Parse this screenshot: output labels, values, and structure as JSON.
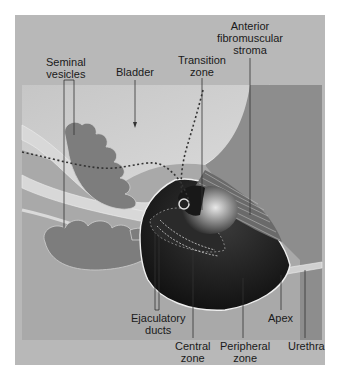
{
  "diagram": {
    "colors": {
      "frame": "#b8b8b8",
      "background_panel": "#a9a9a9",
      "bladder": "#c2c2c2",
      "anterior_region": "#8c8c8c",
      "seminal_vesicles": "#7d7d7d",
      "vas_deferens": "#d8d8d8",
      "peripheral_zone": "#141414",
      "central_zone": "#2a2a2a",
      "transition_zone": "#6e6e6e",
      "outline": "#e6e6e6",
      "leader_line": "#333333",
      "label_text": "#1a1a1a"
    },
    "labels": {
      "seminal_vesicles": [
        "Seminal",
        "vesicles"
      ],
      "bladder": [
        "Bladder"
      ],
      "transition_zone": [
        "Transition",
        "zone"
      ],
      "anterior_fibromuscular_stroma": [
        "Anterior",
        "fibromuscular",
        "stroma"
      ],
      "ejaculatory_ducts": [
        "Ejaculatory",
        "ducts"
      ],
      "central_zone": [
        "Central",
        "zone"
      ],
      "peripheral_zone": [
        "Peripheral",
        "zone"
      ],
      "apex": [
        "Apex"
      ],
      "urethra": [
        "Urethra"
      ]
    }
  }
}
